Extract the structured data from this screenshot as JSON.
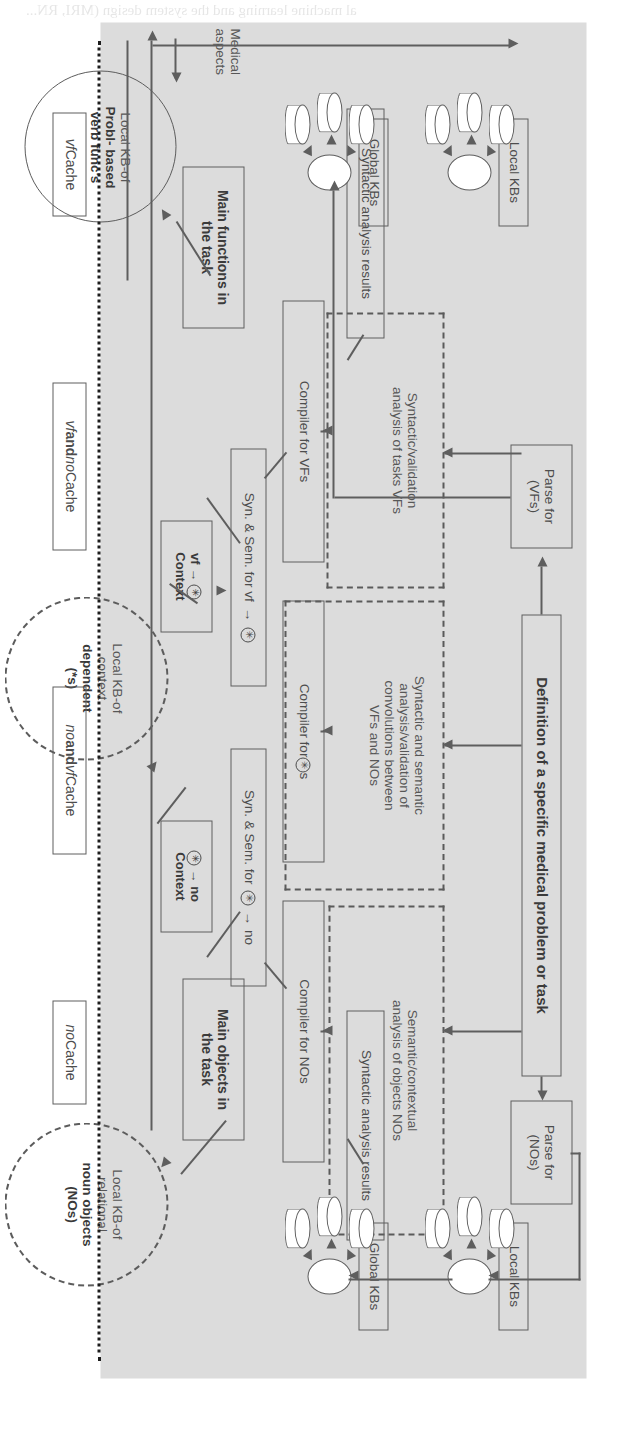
{
  "figure": {
    "orientation": "rotated-90",
    "plate_color": "#dcdcdc",
    "line_color": "#5e5e5e"
  },
  "pipelines": {
    "nos": {
      "parse": "Parse for\n(NOs)",
      "parse_line1": "Parse for",
      "parse_line2": "(NOs)",
      "analysis_line1": "Semantic/contextual",
      "analysis_line2": "analysis of objects NOs",
      "compiler": "Compiler for NOs",
      "results": "Syntactic analysis results",
      "synsem": "Syn. & Sem.  for",
      "synsem_from": "no",
      "context_box_line1": "→ no",
      "context_box_line2": "Context",
      "main": "Main objects in\nthe task",
      "main_line1": "Main objects in",
      "main_line2": "the task"
    },
    "vfs": {
      "parse_line1": "Parse for",
      "parse_line2": "(VFs)",
      "analysis_line1": "Syntactic/validation",
      "analysis_line2": "analysis of tasks VFs",
      "compiler": "Compiler for VFs",
      "results": "Syntactic analysis results",
      "synsem": "Syn. & Sem.  for  vf",
      "context_box_line1": "vf →",
      "context_box_line2": "Context",
      "main_line1": "Main functions in",
      "main_line2": "the task"
    },
    "conv": {
      "analysis_line1": "Syntactic and semantic",
      "analysis_line2": "analysis/validation of",
      "analysis_line3": "convolutions between",
      "analysis_line4": "VFs and NOs",
      "compiler_pre": "Compiler for",
      "compiler_post": "s"
    }
  },
  "definition_box": "Definition of a specific medical problem or task",
  "kb_groups": {
    "local_kbs": "Local KBs",
    "global_kbs": "Global KBs"
  },
  "medical": {
    "line1": "Medical",
    "line2": "aspects"
  },
  "knowledge_circles": [
    {
      "id": "nos-kb",
      "style": "dashed",
      "light_line1": "Local KB-of",
      "light_line2": "relational",
      "bold_line1": "noun objects",
      "bold_line2": "(NOs)"
    },
    {
      "id": "context-kb",
      "style": "dash-dot",
      "light_line1": "Local KB-of",
      "light_line2": "context",
      "bold_line1": "dependent",
      "bold_line2": "(*s)"
    },
    {
      "id": "vf-kb",
      "style": "solid",
      "light_line1": "Local KB-of",
      "bold_line1": "Probl- based",
      "bold_line2": "verb func's"
    }
  ],
  "cache_boxes": [
    {
      "id": "no-cache",
      "italic": "no",
      "rest": " Cache"
    },
    {
      "id": "no-and-vf-cache",
      "italic": "no",
      "bold": " and ",
      "italic2": "vf",
      "rest": " Cache"
    },
    {
      "id": "vf-and-no-cache",
      "italic": "vf",
      "bold": " and ",
      "italic2": "no",
      "rest": " Cache"
    },
    {
      "id": "vf-cache",
      "italic": "vf",
      "rest": " Cache"
    }
  ],
  "ghost_text": [
    "al machine learning and the system design (MRI, RN...",
    "which exceeds the intersection of the",
    "standard model the size of an",
    "the analysis of the the part of",
    "the knowledge base of the",
    "in order to evaluate for",
    "the medical analysis",
    "of the problem of"
  ]
}
